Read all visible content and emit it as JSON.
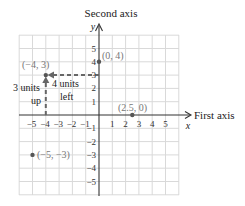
{
  "axes": {
    "y_title": "Second axis",
    "y_var": "y",
    "x_title": "First axis",
    "x_var": "x",
    "x_ticks": [
      "−5",
      "−4",
      "−3",
      "−2",
      "−1",
      "1",
      "2",
      "3",
      "4",
      "5"
    ],
    "y_ticks": [
      "5",
      "4",
      "3",
      "2",
      "1",
      "−1",
      "−2",
      "−3",
      "−4",
      "−5"
    ]
  },
  "points": [
    {
      "label": "(0, 4)",
      "x": 0,
      "y": 4
    },
    {
      "label": "(−4, 3)",
      "x": -4,
      "y": 3
    },
    {
      "label": "(2.5, 0)",
      "x": 2.5,
      "y": 0
    },
    {
      "label": "(−5, −3)",
      "x": -5,
      "y": -3
    }
  ],
  "annotations": {
    "up_line1": "3 units",
    "up_line2": "up",
    "left_line1": "4 units",
    "left_line2": "left"
  },
  "colors": {
    "grid": "#d9d9d9",
    "axis": "#333333",
    "point": "#555555",
    "point_label": "#777777",
    "dashed_path": "#666666",
    "text": "#222222"
  }
}
